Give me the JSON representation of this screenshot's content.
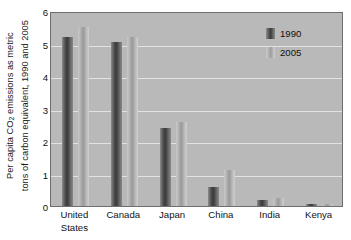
{
  "chart_data": {
    "type": "bar",
    "title": "",
    "xlabel": "",
    "ylabel_line1": "Per capita CO",
    "ylabel_sub": "2",
    "ylabel_line1b": " emissions as metric",
    "ylabel_line2": "tons of carbon equivalent, 1990 and 2005",
    "categories": [
      "United States",
      "Canada",
      "Japan",
      "China",
      "India",
      "Kenya"
    ],
    "category_lines": [
      [
        "United",
        "States"
      ],
      [
        "Canada",
        ""
      ],
      [
        "Japan",
        ""
      ],
      [
        "China",
        ""
      ],
      [
        "India",
        ""
      ],
      [
        "Kenya",
        ""
      ]
    ],
    "series": [
      {
        "name": "1990",
        "values": [
          5.2,
          5.05,
          2.4,
          0.6,
          0.2,
          0.05
        ],
        "color": "#3a3a3a"
      },
      {
        "name": "2005",
        "values": [
          5.5,
          5.2,
          2.6,
          1.1,
          0.25,
          0.06
        ],
        "color": "#a6a6a6"
      }
    ],
    "ylim": [
      0,
      6
    ],
    "yticks": [
      0,
      1,
      2,
      3,
      4,
      5,
      6
    ],
    "ytick_labels": [
      "0",
      "1",
      "2",
      "3",
      "4",
      "5",
      "6"
    ],
    "grid": true,
    "grid_axis": "y",
    "legend_position": "top-right",
    "plot_background": "#b9b9b9",
    "grid_color": "#e2e2e2",
    "axis_color": "#6e6e6e"
  },
  "legend": {
    "entries": [
      {
        "label": "1990"
      },
      {
        "label": "2005"
      }
    ]
  }
}
